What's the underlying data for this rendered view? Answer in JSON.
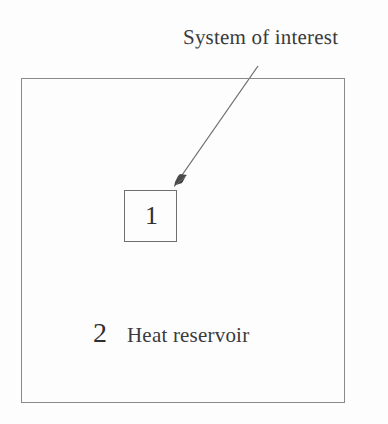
{
  "figure": {
    "type": "diagram",
    "background_color": "#fdfdfd",
    "line_color": "#8a8a8a",
    "text_color": "#3b3b3b"
  },
  "caption": {
    "text": "System of interest"
  },
  "outer_box": {
    "label_index": "2",
    "label_name": "Heat reservoir"
  },
  "inner_box": {
    "label_index": "1"
  },
  "arrow": {
    "name": "pointer-arrow",
    "from_x": 258,
    "from_y": 66,
    "to_x": 175,
    "to_y": 186
  }
}
